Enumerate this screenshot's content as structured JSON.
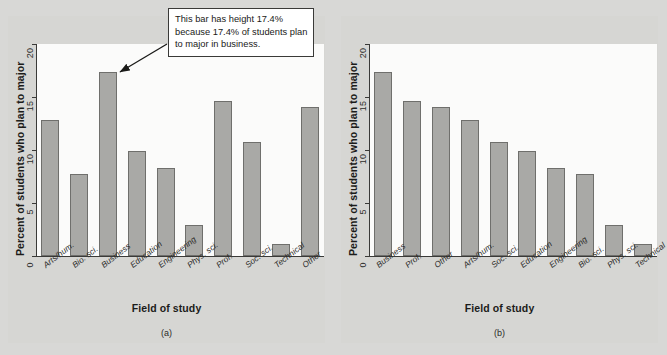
{
  "figure": {
    "callout": {
      "text": "This bar has height 17.4% because 17.4% of students plan to major in business.",
      "points_to": "Business"
    },
    "panels": [
      {
        "sublabel": "(a)"
      },
      {
        "sublabel": "(b)"
      }
    ]
  },
  "chart_data": [
    {
      "type": "bar",
      "title": "",
      "panel": "(a)",
      "xlabel": "Field of study",
      "ylabel": "Percent of students who plan to major",
      "ylim": [
        0,
        20
      ],
      "yticks": [
        0,
        5,
        10,
        15,
        20
      ],
      "ytick_labels": [
        "0",
        "5",
        "10",
        "15",
        "20"
      ],
      "grid": false,
      "legend": "none",
      "sorted": false,
      "categories": [
        "Arts/hum.",
        "Bio. sci.",
        "Business",
        "Education",
        "Engineering",
        "Phys. sci.",
        "Prof.",
        "Soc. sci.",
        "Technical",
        "Other"
      ],
      "values": [
        12.8,
        7.7,
        17.4,
        9.9,
        8.3,
        2.9,
        14.6,
        10.8,
        1.1,
        14.1
      ]
    },
    {
      "type": "bar",
      "title": "",
      "panel": "(b)",
      "xlabel": "Field of study",
      "ylabel": "Percent of students who plan to major",
      "ylim": [
        0,
        20
      ],
      "yticks": [
        0,
        5,
        10,
        15,
        20
      ],
      "ytick_labels": [
        "0",
        "5",
        "10",
        "15",
        "20"
      ],
      "grid": false,
      "legend": "none",
      "sorted": true,
      "categories": [
        "Business",
        "Prof.",
        "Other",
        "Arts/hum.",
        "Soc. sci.",
        "Education",
        "Engineering",
        "Bio. sci.",
        "Phys. sci.",
        "Technical"
      ],
      "values": [
        17.4,
        14.6,
        14.1,
        12.8,
        10.8,
        9.9,
        8.3,
        7.7,
        2.9,
        1.1
      ]
    }
  ],
  "colors": {
    "bar_fill": "#a9a9a6",
    "bar_stroke": "#6f6f6c",
    "page_background": "#d6d6d3",
    "plot_background": "#fbfbfa",
    "axis": "#3a3a38"
  }
}
